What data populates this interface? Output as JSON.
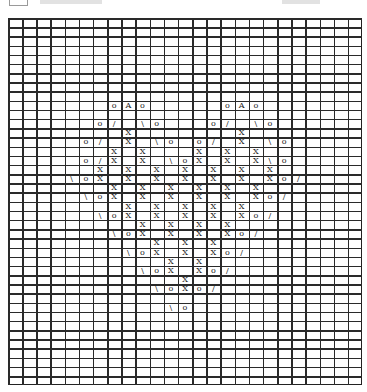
{
  "header": {
    "icon": "box-icon",
    "title_visible": false
  },
  "chart": {
    "type": "knitting-chart",
    "columns": 25,
    "rows": 40,
    "cell_width": 14.16,
    "cell_height": 9.18,
    "origin": [
      8,
      18
    ],
    "grid_color": "#2a2a2a",
    "legend_symbols": {
      "o": "yarn over",
      "/": "right-leaning decrease",
      "\\": "left-leaning decrease",
      "X": "cross/twist stitch",
      "A": "double decrease"
    },
    "cells": [
      {
        "r": 9,
        "c": 7,
        "s": "o"
      },
      {
        "r": 9,
        "c": 8,
        "s": "A"
      },
      {
        "r": 9,
        "c": 9,
        "s": "o"
      },
      {
        "r": 9,
        "c": 15,
        "s": "o"
      },
      {
        "r": 9,
        "c": 16,
        "s": "A"
      },
      {
        "r": 9,
        "c": 17,
        "s": "o"
      },
      {
        "r": 11,
        "c": 6,
        "s": "o"
      },
      {
        "r": 11,
        "c": 7,
        "s": "/"
      },
      {
        "r": 11,
        "c": 9,
        "s": "\\"
      },
      {
        "r": 11,
        "c": 10,
        "s": "o"
      },
      {
        "r": 11,
        "c": 14,
        "s": "o"
      },
      {
        "r": 11,
        "c": 15,
        "s": "/"
      },
      {
        "r": 11,
        "c": 17,
        "s": "\\"
      },
      {
        "r": 11,
        "c": 18,
        "s": "o"
      },
      {
        "r": 12,
        "c": 8,
        "s": "X"
      },
      {
        "r": 12,
        "c": 16,
        "s": "X"
      },
      {
        "r": 13,
        "c": 5,
        "s": "o"
      },
      {
        "r": 13,
        "c": 6,
        "s": "/"
      },
      {
        "r": 13,
        "c": 8,
        "s": "X"
      },
      {
        "r": 13,
        "c": 10,
        "s": "\\"
      },
      {
        "r": 13,
        "c": 11,
        "s": "o"
      },
      {
        "r": 13,
        "c": 13,
        "s": "o"
      },
      {
        "r": 13,
        "c": 14,
        "s": "/"
      },
      {
        "r": 13,
        "c": 16,
        "s": "X"
      },
      {
        "r": 13,
        "c": 18,
        "s": "\\"
      },
      {
        "r": 13,
        "c": 19,
        "s": "o"
      },
      {
        "r": 14,
        "c": 7,
        "s": "X"
      },
      {
        "r": 14,
        "c": 9,
        "s": "X"
      },
      {
        "r": 14,
        "c": 13,
        "s": "X"
      },
      {
        "r": 14,
        "c": 15,
        "s": "X"
      },
      {
        "r": 14,
        "c": 17,
        "s": "X"
      },
      {
        "r": 15,
        "c": 5,
        "s": "o"
      },
      {
        "r": 15,
        "c": 6,
        "s": "/"
      },
      {
        "r": 15,
        "c": 7,
        "s": "X"
      },
      {
        "r": 15,
        "c": 9,
        "s": "X"
      },
      {
        "r": 15,
        "c": 11,
        "s": "\\"
      },
      {
        "r": 15,
        "c": 12,
        "s": "o"
      },
      {
        "r": 15,
        "c": 13,
        "s": "X"
      },
      {
        "r": 15,
        "c": 15,
        "s": "X"
      },
      {
        "r": 15,
        "c": 17,
        "s": "X"
      },
      {
        "r": 15,
        "c": 18,
        "s": "\\"
      },
      {
        "r": 15,
        "c": 19,
        "s": "o"
      },
      {
        "r": 16,
        "c": 6,
        "s": "X"
      },
      {
        "r": 16,
        "c": 8,
        "s": "X"
      },
      {
        "r": 16,
        "c": 10,
        "s": "X"
      },
      {
        "r": 16,
        "c": 12,
        "s": "X"
      },
      {
        "r": 16,
        "c": 14,
        "s": "X"
      },
      {
        "r": 16,
        "c": 16,
        "s": "X"
      },
      {
        "r": 16,
        "c": 18,
        "s": "X"
      },
      {
        "r": 17,
        "c": 4,
        "s": "\\"
      },
      {
        "r": 17,
        "c": 5,
        "s": "o"
      },
      {
        "r": 17,
        "c": 6,
        "s": "X"
      },
      {
        "r": 17,
        "c": 8,
        "s": "X"
      },
      {
        "r": 17,
        "c": 10,
        "s": "X"
      },
      {
        "r": 17,
        "c": 12,
        "s": "X"
      },
      {
        "r": 17,
        "c": 14,
        "s": "X"
      },
      {
        "r": 17,
        "c": 16,
        "s": "X"
      },
      {
        "r": 17,
        "c": 18,
        "s": "X"
      },
      {
        "r": 17,
        "c": 19,
        "s": "o"
      },
      {
        "r": 17,
        "c": 20,
        "s": "/"
      },
      {
        "r": 18,
        "c": 7,
        "s": "X"
      },
      {
        "r": 18,
        "c": 9,
        "s": "X"
      },
      {
        "r": 18,
        "c": 11,
        "s": "X"
      },
      {
        "r": 18,
        "c": 13,
        "s": "X"
      },
      {
        "r": 18,
        "c": 15,
        "s": "X"
      },
      {
        "r": 18,
        "c": 17,
        "s": "X"
      },
      {
        "r": 19,
        "c": 5,
        "s": "\\"
      },
      {
        "r": 19,
        "c": 6,
        "s": "o"
      },
      {
        "r": 19,
        "c": 7,
        "s": "X"
      },
      {
        "r": 19,
        "c": 9,
        "s": "X"
      },
      {
        "r": 19,
        "c": 11,
        "s": "X"
      },
      {
        "r": 19,
        "c": 13,
        "s": "X"
      },
      {
        "r": 19,
        "c": 15,
        "s": "X"
      },
      {
        "r": 19,
        "c": 17,
        "s": "X"
      },
      {
        "r": 19,
        "c": 18,
        "s": "o"
      },
      {
        "r": 19,
        "c": 19,
        "s": "/"
      },
      {
        "r": 20,
        "c": 8,
        "s": "X"
      },
      {
        "r": 20,
        "c": 10,
        "s": "X"
      },
      {
        "r": 20,
        "c": 12,
        "s": "X"
      },
      {
        "r": 20,
        "c": 14,
        "s": "X"
      },
      {
        "r": 20,
        "c": 16,
        "s": "X"
      },
      {
        "r": 21,
        "c": 6,
        "s": "\\"
      },
      {
        "r": 21,
        "c": 7,
        "s": "o"
      },
      {
        "r": 21,
        "c": 8,
        "s": "X"
      },
      {
        "r": 21,
        "c": 10,
        "s": "X"
      },
      {
        "r": 21,
        "c": 12,
        "s": "X"
      },
      {
        "r": 21,
        "c": 14,
        "s": "X"
      },
      {
        "r": 21,
        "c": 16,
        "s": "X"
      },
      {
        "r": 21,
        "c": 17,
        "s": "o"
      },
      {
        "r": 21,
        "c": 18,
        "s": "/"
      },
      {
        "r": 22,
        "c": 9,
        "s": "X"
      },
      {
        "r": 22,
        "c": 11,
        "s": "X"
      },
      {
        "r": 22,
        "c": 13,
        "s": "X"
      },
      {
        "r": 22,
        "c": 15,
        "s": "X"
      },
      {
        "r": 23,
        "c": 7,
        "s": "\\"
      },
      {
        "r": 23,
        "c": 8,
        "s": "o"
      },
      {
        "r": 23,
        "c": 9,
        "s": "X"
      },
      {
        "r": 23,
        "c": 11,
        "s": "X"
      },
      {
        "r": 23,
        "c": 13,
        "s": "X"
      },
      {
        "r": 23,
        "c": 15,
        "s": "X"
      },
      {
        "r": 23,
        "c": 16,
        "s": "o"
      },
      {
        "r": 23,
        "c": 17,
        "s": "/"
      },
      {
        "r": 24,
        "c": 10,
        "s": "X"
      },
      {
        "r": 24,
        "c": 12,
        "s": "X"
      },
      {
        "r": 24,
        "c": 14,
        "s": "X"
      },
      {
        "r": 25,
        "c": 8,
        "s": "\\"
      },
      {
        "r": 25,
        "c": 9,
        "s": "o"
      },
      {
        "r": 25,
        "c": 10,
        "s": "X"
      },
      {
        "r": 25,
        "c": 12,
        "s": "X"
      },
      {
        "r": 25,
        "c": 14,
        "s": "X"
      },
      {
        "r": 25,
        "c": 15,
        "s": "o"
      },
      {
        "r": 25,
        "c": 16,
        "s": "/"
      },
      {
        "r": 26,
        "c": 11,
        "s": "X"
      },
      {
        "r": 26,
        "c": 13,
        "s": "X"
      },
      {
        "r": 27,
        "c": 9,
        "s": "\\"
      },
      {
        "r": 27,
        "c": 10,
        "s": "o"
      },
      {
        "r": 27,
        "c": 11,
        "s": "X"
      },
      {
        "r": 27,
        "c": 13,
        "s": "X"
      },
      {
        "r": 27,
        "c": 14,
        "s": "o"
      },
      {
        "r": 27,
        "c": 15,
        "s": "/"
      },
      {
        "r": 28,
        "c": 12,
        "s": "X"
      },
      {
        "r": 29,
        "c": 10,
        "s": "\\"
      },
      {
        "r": 29,
        "c": 11,
        "s": "o"
      },
      {
        "r": 29,
        "c": 12,
        "s": "X"
      },
      {
        "r": 29,
        "c": 13,
        "s": "o"
      },
      {
        "r": 29,
        "c": 14,
        "s": "/"
      },
      {
        "r": 31,
        "c": 11,
        "s": "\\"
      },
      {
        "r": 31,
        "c": 12,
        "s": "o"
      }
    ]
  }
}
